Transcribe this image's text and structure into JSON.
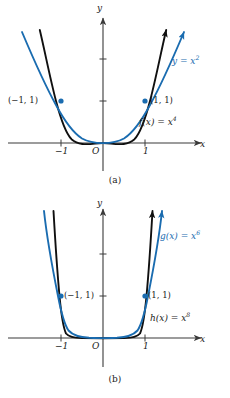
{
  "figure": {
    "type": "math-graph-figure",
    "background": "#ffffff",
    "colors": {
      "curve_blue": "#1a6cb0",
      "curve_black": "#101010",
      "axis": "#3a3a3a",
      "text": "#1a1a1a"
    }
  },
  "panels": [
    {
      "id": "a",
      "caption": "(a)",
      "axis": {
        "x_label": "x",
        "y_label": "y",
        "x_ticks": [
          "-1",
          "1"
        ],
        "origin_label": "O"
      },
      "curves": [
        {
          "name": "y = x^2",
          "label_text": "y = x",
          "label_exp": "2",
          "color": "#1a6cb0",
          "exponent": 2
        },
        {
          "name": "f(x) = x^4",
          "label_text": "f(x) = x",
          "label_exp": "4",
          "color": "#101010",
          "exponent": 4
        }
      ],
      "points": [
        {
          "label": "(−1, 1)",
          "x": -1,
          "y": 1
        },
        {
          "label": "(1, 1)",
          "x": 1,
          "y": 1
        }
      ]
    },
    {
      "id": "b",
      "caption": "(b)",
      "axis": {
        "x_label": "x",
        "y_label": "y",
        "x_ticks": [
          "-1",
          "1"
        ],
        "origin_label": "O"
      },
      "curves": [
        {
          "name": "g(x) = x^6",
          "label_text": "g(x) = x",
          "label_exp": "6",
          "color": "#1a6cb0",
          "exponent": 6
        },
        {
          "name": "h(x) = x^8",
          "label_text": "h(x) = x",
          "label_exp": "8",
          "color": "#101010",
          "exponent": 8
        }
      ],
      "points": [
        {
          "label": "(−1, 1)",
          "x": -1,
          "y": 1
        },
        {
          "label": "(1, 1)",
          "x": 1,
          "y": 1
        }
      ]
    }
  ],
  "labels": {
    "a_blue": "y = x",
    "a_blue_exp": "2",
    "a_black": "f(x) = x",
    "a_black_exp": "4",
    "b_blue": "g(x) = x",
    "b_blue_exp": "6",
    "b_black": "h(x) = x",
    "b_black_exp": "8",
    "neg_one_one": "(−1, 1)",
    "one_one": "(1, 1)",
    "x_axis": "x",
    "y_axis": "y",
    "origin": "O",
    "tick_neg_one": "−1",
    "tick_one": "1",
    "caption_a": "(a)",
    "caption_b": "(b)"
  }
}
